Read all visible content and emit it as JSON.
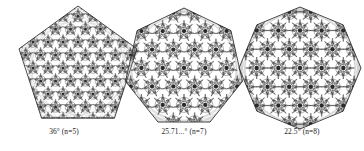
{
  "figure": {
    "background_color": "#ffffff",
    "ink_color": "#2b2b2b",
    "caption_color": "#1c1c1c",
    "panels": [
      {
        "id": "pentagon",
        "name": "pentagon-tiling",
        "sides": 5,
        "angle_label": "36°",
        "n_label": "(n=5)",
        "caption": "36° (n=5)",
        "angle_value": 36,
        "center_x": 78,
        "center_y": 68,
        "radius": 62,
        "rotation_deg": -90,
        "rings": 7,
        "motif_scale": 0.085,
        "line_width": 0.34,
        "density": "very-fine"
      },
      {
        "id": "heptagon",
        "name": "heptagon-tiling",
        "sides": 7,
        "angle_label": "25.71...°",
        "n_label": "(n=7)",
        "caption": "25.71...° (n=7)",
        "angle_value": 25.714,
        "center_x": 184,
        "center_y": 68,
        "radius": 60,
        "rotation_deg": -90,
        "rings": 5,
        "motif_scale": 0.125,
        "line_width": 0.36,
        "density": "medium"
      },
      {
        "id": "octagon",
        "name": "octagon-tiling",
        "sides": 8,
        "angle_label": "22.5°",
        "n_label": "(n=8)",
        "caption": "22.5° (n=8)",
        "angle_value": 22.5,
        "center_x": 300,
        "center_y": 68,
        "radius": 61,
        "rotation_deg": -90,
        "rings": 5,
        "motif_scale": 0.125,
        "line_width": 0.36,
        "density": "medium"
      }
    ]
  }
}
